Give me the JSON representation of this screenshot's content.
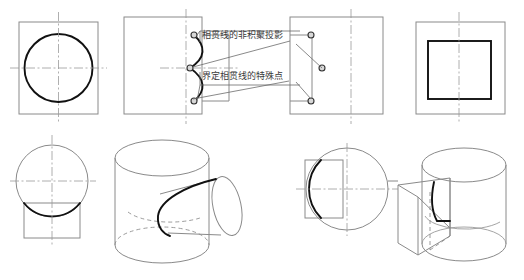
{
  "figure": {
    "annotations": [
      {
        "id": "non-accumulated-projection",
        "text": "相贯线的非积聚投影"
      },
      {
        "id": "special-points",
        "text": "界定相贯线的特殊点"
      }
    ],
    "colors": {
      "construction_line": "#8a8a8a",
      "intersection_curve": "#111111",
      "center_line": "#9a9a9a",
      "leader_line": "#6b6b6b",
      "point_marker_fill": "#d8d8d8",
      "point_marker_stroke": "#333333",
      "background": "#ffffff",
      "label_text": "#3a3a3a"
    },
    "views": [
      {
        "id": "top-left-front-view",
        "name": "front-view-circle-in-rect",
        "row": "top",
        "column": 1,
        "description": "Rectangle outline with inscribed bold circle and dash-dot centerlines"
      },
      {
        "id": "top-mid-side-view",
        "name": "side-view-intersection-curve",
        "row": "top",
        "column": 2,
        "description": "Rectangle with protruding small rectangle at right and bold intersection curve carrying three special points",
        "special_point_count": 3
      },
      {
        "id": "top-right-leader-view",
        "name": "projection-view-with-leaders",
        "row": "top",
        "column": 3,
        "description": "Rectangle with vertical centerline and three special points joined by leader lines to annotations",
        "special_point_count": 3
      },
      {
        "id": "top-far-right-top-view",
        "name": "top-view-rect-in-rect",
        "row": "top",
        "column": 4,
        "description": "Outer rectangle with bold inner rectangle and vertical centerline"
      },
      {
        "id": "bottom-left-top-view",
        "name": "top-view-circle-over-rect",
        "row": "bottom",
        "column": 1,
        "description": "Circle with rectangle below, bold arc marking the intersection"
      },
      {
        "id": "bottom-mid-isometric",
        "name": "isometric-cylinder-cylinder",
        "row": "bottom",
        "column": 2,
        "description": "Isometric vertical cylinder pierced by a horizontal cylinder from the right with bold intersection curve"
      },
      {
        "id": "bottom-third-top-view",
        "name": "top-view-circle-with-left-rect",
        "row": "bottom",
        "column": 3,
        "description": "Circle with rectangle at left and bold arc marking the intersection"
      },
      {
        "id": "bottom-right-isometric",
        "name": "isometric-cylinder-prism",
        "row": "bottom",
        "column": 4,
        "description": "Isometric vertical cylinder with rectangular prism slot entering from the left and bold intersection curve"
      }
    ]
  }
}
